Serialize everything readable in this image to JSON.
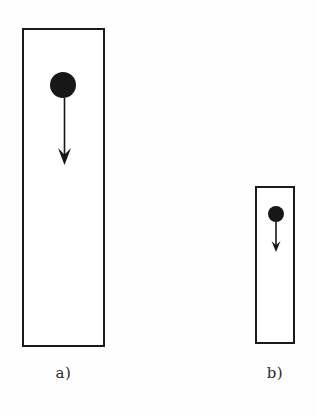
{
  "figure": {
    "background_color": "#fefefe",
    "ink_color": "#171717",
    "panels": [
      {
        "id": "a",
        "label": "a)",
        "container": {
          "shape": "rectangle",
          "x": 22,
          "y": 28,
          "width": 83,
          "height": 319,
          "stroke_color": "#1a1a1a",
          "stroke_width": 2.5,
          "fill": "#ffffff"
        },
        "disc": {
          "shape": "filled-circle",
          "cx": 63,
          "cy": 85,
          "radius": 13,
          "fill": "#171717"
        },
        "arrow": {
          "direction": "down",
          "x": 64,
          "y_start": 98,
          "y_end": 165,
          "shaft_width": 1.4,
          "head_length": 17,
          "head_width": 13,
          "color": "#171717"
        }
      },
      {
        "id": "b",
        "label": "b)",
        "container": {
          "shape": "rectangle",
          "x": 255,
          "y": 186,
          "width": 40,
          "height": 158,
          "stroke_color": "#1a1a1a",
          "stroke_width": 2.5,
          "fill": "#ffffff"
        },
        "disc": {
          "shape": "filled-circle",
          "cx": 276,
          "cy": 214,
          "radius": 8,
          "fill": "#171717"
        },
        "arrow": {
          "direction": "down",
          "x": 276,
          "y_start": 222,
          "y_end": 252,
          "shaft_width": 1.4,
          "head_length": 11,
          "head_width": 9,
          "color": "#171717"
        }
      }
    ]
  }
}
